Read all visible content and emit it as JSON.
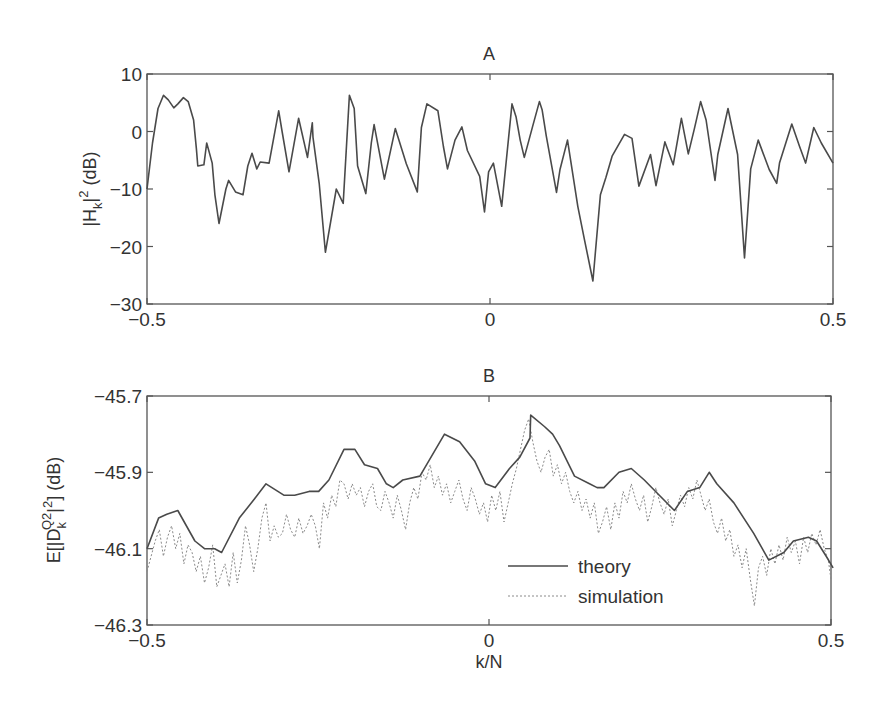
{
  "figure": {
    "colors": {
      "axis": "#555555",
      "theory": "#4a4a4a",
      "simulation": "#8a8a8a",
      "background": "#ffffff"
    }
  },
  "chart_data": [
    {
      "id": "A",
      "type": "line",
      "title": "A",
      "xlabel": "",
      "ylabel": "|H_k|^2 (dB)",
      "ylabel_parts": {
        "main": "|H",
        "sub": "k",
        "rest": "|",
        "sup": "2",
        "tail": " (dB)"
      },
      "xlim": [
        -0.5,
        0.5
      ],
      "ylim": [
        -30,
        10
      ],
      "xticks": [
        -0.5,
        0,
        0.5
      ],
      "xtick_labels": [
        "−0.5",
        "0",
        "0.5"
      ],
      "yticks": [
        10,
        0,
        -10,
        -20,
        -30
      ],
      "ytick_labels": [
        "10",
        "0",
        "−10",
        "−20",
        "−30"
      ],
      "grid": false,
      "series": [
        {
          "name": "|H_k|^2",
          "style": "solid",
          "x": [
            -0.5,
            -0.492,
            -0.484,
            -0.476,
            -0.469,
            -0.461,
            -0.455,
            -0.447,
            -0.44,
            -0.432,
            -0.428,
            -0.426,
            -0.417,
            -0.413,
            -0.405,
            -0.401,
            -0.395,
            -0.385,
            -0.381,
            -0.371,
            -0.36,
            -0.353,
            -0.347,
            -0.34,
            -0.335,
            -0.322,
            -0.308,
            -0.303,
            -0.293,
            -0.279,
            -0.266,
            -0.259,
            -0.258,
            -0.249,
            -0.24,
            -0.224,
            -0.214,
            -0.205,
            -0.198,
            -0.193,
            -0.181,
            -0.173,
            -0.169,
            -0.154,
            -0.138,
            -0.122,
            -0.106,
            -0.1,
            -0.092,
            -0.076,
            -0.068,
            -0.062,
            -0.051,
            -0.041,
            -0.033,
            -0.015,
            -0.008,
            -0.002,
            0.005,
            0.017,
            0.032,
            0.038,
            0.044,
            0.05,
            0.062,
            0.072,
            0.076,
            0.082,
            0.097,
            0.102,
            0.113,
            0.128,
            0.138,
            0.15,
            0.161,
            0.169,
            0.178,
            0.196,
            0.207,
            0.217,
            0.234,
            0.242,
            0.255,
            0.267,
            0.279,
            0.289,
            0.298,
            0.307,
            0.315,
            0.328,
            0.332,
            0.347,
            0.361,
            0.371,
            0.38,
            0.391,
            0.407,
            0.418,
            0.422,
            0.44,
            0.451,
            0.46,
            0.472,
            0.483,
            0.5
          ],
          "y": [
            -10.0,
            -2.0,
            4.0,
            6.3,
            5.5,
            4.1,
            4.8,
            5.9,
            5.2,
            2.0,
            -3.0,
            -6.0,
            -5.8,
            -2.0,
            -5.5,
            -11.0,
            -16.0,
            -10.0,
            -8.5,
            -10.5,
            -11.0,
            -6.0,
            -3.8,
            -6.5,
            -5.3,
            -5.5,
            3.6,
            0.0,
            -7.0,
            2.3,
            -4.5,
            1.5,
            -1.0,
            -9.0,
            -21.0,
            -10.0,
            -12.5,
            6.3,
            4.0,
            -6.0,
            -10.8,
            -2.0,
            1.2,
            -8.3,
            0.5,
            -5.6,
            -10.5,
            0.7,
            4.8,
            3.6,
            -2.6,
            -6.5,
            -1.5,
            0.8,
            -3.3,
            -7.8,
            -14.0,
            -7.0,
            -5.5,
            -13.0,
            4.8,
            2.5,
            -1.5,
            -4.5,
            0.8,
            5.2,
            3.8,
            -0.8,
            -10.6,
            -6.6,
            -1.5,
            -13.0,
            -19.0,
            -26.0,
            -11.0,
            -8.0,
            -4.3,
            -0.5,
            -1.2,
            -9.5,
            -4.0,
            -9.4,
            -1.8,
            -5.8,
            2.3,
            -3.9,
            0.5,
            5.2,
            2.0,
            -8.5,
            -4.0,
            4.0,
            -4.0,
            -22.0,
            -6.5,
            -1.5,
            -6.6,
            -9.0,
            -5.5,
            1.3,
            -2.5,
            -5.5,
            0.7,
            -2.0,
            -5.5
          ]
        }
      ]
    },
    {
      "id": "B",
      "type": "line",
      "title": "B",
      "xlabel": "k/N",
      "ylabel": "E[|D_k^{Q2}|^2] (dB)",
      "ylabel_parts": {
        "main": "E[|D",
        "sub": "k",
        "sup": "Q2",
        "rest": "|",
        "sup2": "2",
        "tail": "] (dB)"
      },
      "xlim": [
        -0.5,
        0.5
      ],
      "ylim": [
        -46.3,
        -45.7
      ],
      "xticks": [
        -0.5,
        0,
        0.5
      ],
      "xtick_labels": [
        "−0.5",
        "0",
        "0.5"
      ],
      "yticks": [
        -45.7,
        -45.9,
        -46.1,
        -46.3
      ],
      "ytick_labels": [
        "−45.7",
        "−45.9",
        "−46.1",
        "−46.3"
      ],
      "grid": false,
      "legend": {
        "position": "lower right",
        "entries": [
          "theory",
          "simulation"
        ]
      },
      "series": [
        {
          "name": "theory",
          "style": "solid",
          "x": [
            -0.5,
            -0.483,
            -0.471,
            -0.455,
            -0.43,
            -0.416,
            -0.401,
            -0.391,
            -0.365,
            -0.343,
            -0.326,
            -0.3,
            -0.284,
            -0.263,
            -0.249,
            -0.234,
            -0.212,
            -0.196,
            -0.182,
            -0.163,
            -0.15,
            -0.14,
            -0.126,
            -0.101,
            -0.065,
            -0.043,
            -0.021,
            -0.005,
            0.009,
            0.03,
            0.045,
            0.06,
            0.061,
            0.081,
            0.093,
            0.103,
            0.125,
            0.147,
            0.158,
            0.168,
            0.19,
            0.208,
            0.227,
            0.249,
            0.271,
            0.29,
            0.308,
            0.322,
            0.333,
            0.358,
            0.387,
            0.409,
            0.431,
            0.445,
            0.467,
            0.479,
            0.493,
            0.503
          ],
          "y": [
            -46.1,
            -46.02,
            -46.01,
            -46.0,
            -46.08,
            -46.1,
            -46.1,
            -46.11,
            -46.02,
            -45.97,
            -45.93,
            -45.96,
            -45.96,
            -45.95,
            -45.95,
            -45.92,
            -45.84,
            -45.84,
            -45.88,
            -45.89,
            -45.93,
            -45.94,
            -45.92,
            -45.91,
            -45.8,
            -45.82,
            -45.87,
            -45.93,
            -45.94,
            -45.89,
            -45.86,
            -45.81,
            -45.75,
            -45.78,
            -45.8,
            -45.83,
            -45.91,
            -45.93,
            -45.94,
            -45.94,
            -45.9,
            -45.89,
            -45.92,
            -45.96,
            -46.0,
            -45.95,
            -45.94,
            -45.9,
            -45.93,
            -45.98,
            -46.06,
            -46.13,
            -46.11,
            -46.08,
            -46.07,
            -46.08,
            -46.12,
            -46.15
          ]
        },
        {
          "name": "simulation",
          "style": "dotted",
          "x": [
            -0.5,
            -0.494,
            -0.488,
            -0.482,
            -0.476,
            -0.47,
            -0.464,
            -0.458,
            -0.452,
            -0.446,
            -0.44,
            -0.434,
            -0.428,
            -0.422,
            -0.416,
            -0.41,
            -0.404,
            -0.398,
            -0.392,
            -0.386,
            -0.38,
            -0.374,
            -0.368,
            -0.362,
            -0.356,
            -0.35,
            -0.344,
            -0.338,
            -0.332,
            -0.326,
            -0.32,
            -0.314,
            -0.308,
            -0.302,
            -0.296,
            -0.29,
            -0.284,
            -0.278,
            -0.272,
            -0.266,
            -0.26,
            -0.254,
            -0.248,
            -0.242,
            -0.236,
            -0.23,
            -0.224,
            -0.218,
            -0.212,
            -0.206,
            -0.2,
            -0.194,
            -0.188,
            -0.182,
            -0.176,
            -0.17,
            -0.164,
            -0.158,
            -0.152,
            -0.146,
            -0.14,
            -0.134,
            -0.128,
            -0.122,
            -0.116,
            -0.11,
            -0.104,
            -0.098,
            -0.092,
            -0.086,
            -0.08,
            -0.074,
            -0.068,
            -0.062,
            -0.056,
            -0.05,
            -0.044,
            -0.038,
            -0.032,
            -0.026,
            -0.02,
            -0.014,
            -0.008,
            -0.002,
            0.004,
            0.01,
            0.016,
            0.022,
            0.028,
            0.034,
            0.04,
            0.046,
            0.052,
            0.058,
            0.064,
            0.07,
            0.076,
            0.082,
            0.088,
            0.094,
            0.1,
            0.106,
            0.112,
            0.118,
            0.124,
            0.13,
            0.136,
            0.142,
            0.148,
            0.154,
            0.16,
            0.166,
            0.172,
            0.178,
            0.184,
            0.19,
            0.196,
            0.202,
            0.208,
            0.214,
            0.22,
            0.226,
            0.232,
            0.238,
            0.244,
            0.25,
            0.256,
            0.262,
            0.268,
            0.274,
            0.28,
            0.286,
            0.292,
            0.298,
            0.304,
            0.31,
            0.316,
            0.322,
            0.328,
            0.334,
            0.34,
            0.346,
            0.352,
            0.358,
            0.364,
            0.37,
            0.376,
            0.382,
            0.388,
            0.394,
            0.4,
            0.406,
            0.412,
            0.418,
            0.424,
            0.43,
            0.436,
            0.442,
            0.448,
            0.454,
            0.46,
            0.466,
            0.472,
            0.478,
            0.484,
            0.49,
            0.496,
            0.5
          ],
          "y": [
            -46.16,
            -46.12,
            -46.08,
            -46.05,
            -46.12,
            -46.07,
            -46.04,
            -46.1,
            -46.06,
            -46.14,
            -46.09,
            -46.11,
            -46.16,
            -46.12,
            -46.19,
            -46.15,
            -46.09,
            -46.2,
            -46.17,
            -46.14,
            -46.2,
            -46.11,
            -46.19,
            -46.13,
            -46.04,
            -46.09,
            -46.16,
            -46.1,
            -46.02,
            -45.98,
            -46.08,
            -46.04,
            -46.07,
            -46.06,
            -46.01,
            -46.05,
            -46.07,
            -46.02,
            -46.06,
            -46.04,
            -46.01,
            -46.04,
            -46.1,
            -45.98,
            -46.02,
            -45.96,
            -45.99,
            -45.92,
            -45.93,
            -45.97,
            -45.93,
            -45.96,
            -45.94,
            -45.99,
            -45.95,
            -45.93,
            -45.99,
            -46.0,
            -45.95,
            -45.98,
            -46.02,
            -45.96,
            -46.0,
            -46.05,
            -45.98,
            -45.94,
            -45.97,
            -45.9,
            -45.92,
            -45.88,
            -45.94,
            -45.91,
            -45.96,
            -45.93,
            -45.98,
            -45.95,
            -45.92,
            -45.97,
            -46.0,
            -45.94,
            -45.97,
            -46.01,
            -45.98,
            -46.03,
            -45.96,
            -46.0,
            -45.95,
            -46.03,
            -45.98,
            -45.93,
            -45.89,
            -45.84,
            -45.79,
            -45.76,
            -45.82,
            -45.87,
            -45.9,
            -45.86,
            -45.84,
            -45.91,
            -45.88,
            -45.93,
            -45.9,
            -45.95,
            -45.98,
            -45.95,
            -46.0,
            -45.97,
            -46.02,
            -45.98,
            -46.06,
            -46.03,
            -45.99,
            -46.05,
            -45.98,
            -46.02,
            -45.95,
            -45.98,
            -45.93,
            -45.97,
            -46.0,
            -45.96,
            -46.03,
            -45.99,
            -45.94,
            -45.98,
            -46.01,
            -45.97,
            -46.04,
            -46.0,
            -45.96,
            -45.99,
            -45.94,
            -45.97,
            -45.92,
            -45.96,
            -46.0,
            -45.97,
            -46.03,
            -46.06,
            -46.02,
            -46.08,
            -46.05,
            -46.12,
            -46.09,
            -46.15,
            -46.1,
            -46.18,
            -46.25,
            -46.15,
            -46.12,
            -46.17,
            -46.1,
            -46.14,
            -46.09,
            -46.13,
            -46.07,
            -46.11,
            -46.08,
            -46.14,
            -46.07,
            -46.11,
            -46.06,
            -46.09,
            -46.05,
            -46.1,
            -46.13,
            -46.18
          ]
        }
      ]
    }
  ]
}
